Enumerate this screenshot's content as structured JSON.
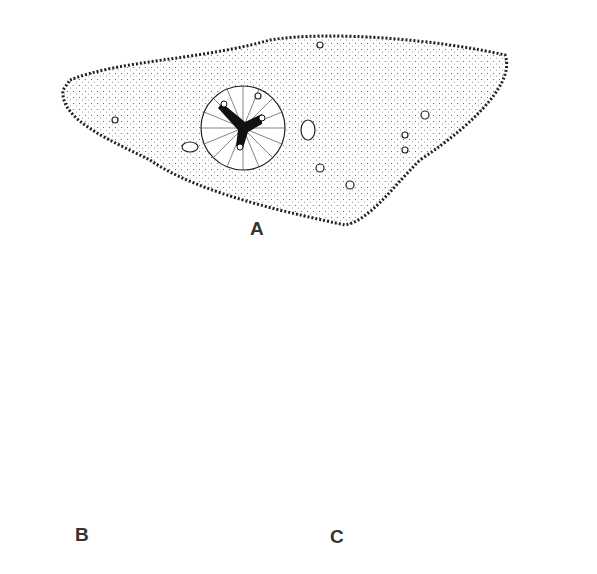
{
  "figure": {
    "panels": [
      {
        "id": "A",
        "label": "A",
        "description": "Elongated cell with stippled cytoplasm, ciliated margin, central radiating capsule with three-armed dark body and nuclei"
      },
      {
        "id": "B",
        "label": "B",
        "description": "Rounded cell with budding sphere at top, radial striations and three dense granular lobes"
      },
      {
        "id": "C",
        "label": "C",
        "description": "Pear-shaped cell with ciliated margin, stippled cytoplasm, scattered nuclei, central oval capsule with dark irregular body and dashed line"
      }
    ],
    "colors": {
      "ink": "#222222",
      "background": "#ffffff"
    }
  }
}
